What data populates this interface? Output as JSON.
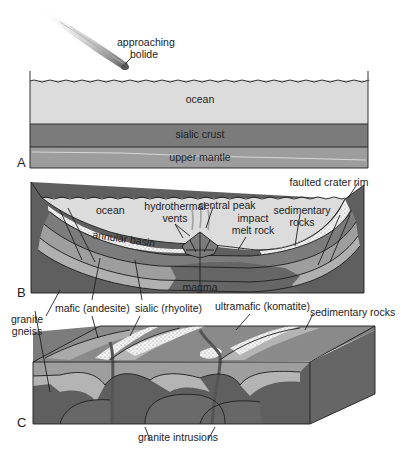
{
  "panels": {
    "a": {
      "letter": "A",
      "labels": {
        "bolide": [
          "approaching",
          "bolide"
        ],
        "ocean": "ocean",
        "crust": "sialic crust",
        "mantle": "upper mantle"
      }
    },
    "b": {
      "letter": "B",
      "labels": {
        "rim": "faulted crater rim",
        "ocean": "ocean",
        "vents": [
          "hydrothermal",
          "vents"
        ],
        "peak": "central peak",
        "melt": [
          "impact",
          "melt rock"
        ],
        "sed": [
          "sedimentary",
          "rocks"
        ],
        "basin": "annular basin",
        "magma": "magma"
      }
    },
    "c": {
      "letter": "C",
      "labels": {
        "gneiss": [
          "granite",
          "gneiss"
        ],
        "mafic": "mafic (andesite)",
        "sialic": "sialic (rhyolite)",
        "ultramafic": "ultramafic (komatite)",
        "sed": "sedimentary rocks",
        "intrusions": "granite intrusions"
      }
    }
  },
  "colors": {
    "ocean": "#dcdcdc",
    "crust": "#7a7a7a",
    "mantle": "#9c9c9c",
    "dark": "#5e5e5e",
    "mid": "#8a8a8a",
    "light": "#b4b4b4",
    "sediment": "#eeeeee"
  }
}
